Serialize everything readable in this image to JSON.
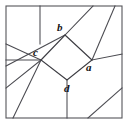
{
  "figure": {
    "canvas": {
      "width": 128,
      "height": 124
    },
    "background_color": "#ffffff",
    "line_color": "#4a4a50",
    "border_color": "#55555a",
    "label_color": "#111114",
    "border": {
      "x": 6,
      "y": 6,
      "width": 116,
      "height": 112
    },
    "labels": [
      {
        "id": "a",
        "text": "a",
        "x": 86,
        "y": 62,
        "vertex_x": 92,
        "vertex_y": 60
      },
      {
        "id": "b",
        "text": "b",
        "x": 57,
        "y": 22,
        "vertex_x": 65,
        "vertex_y": 35
      },
      {
        "id": "c",
        "text": "c",
        "x": 33,
        "y": 47,
        "vertex_x": 41,
        "vertex_y": 60
      },
      {
        "id": "d",
        "text": "d",
        "x": 64,
        "y": 83,
        "vertex_x": 67,
        "vertex_y": 80
      }
    ],
    "quadrilateral": {
      "name": "central-quadrilateral",
      "points": "65,35 92,60 67,80 41,60"
    },
    "segments": [
      {
        "name": "segment-b-to-top-edge",
        "x1": 65,
        "y1": 35,
        "x2": 93,
        "y2": 6
      },
      {
        "name": "segment-b-to-c-extended-left-edge",
        "x1": 65,
        "y1": 35,
        "x2": 6,
        "y2": 66
      },
      {
        "name": "segment-c-to-left-edge-horizontal",
        "x1": 41,
        "y1": 60,
        "x2": 6,
        "y2": 60
      },
      {
        "name": "segment-c-to-upper-left-edge",
        "x1": 41,
        "y1": 60,
        "x2": 6,
        "y2": 44
      },
      {
        "name": "segment-c-to-lower-left-edge",
        "x1": 41,
        "y1": 60,
        "x2": 6,
        "y2": 88
      },
      {
        "name": "segment-c-to-bottom-edge",
        "x1": 41,
        "y1": 60,
        "x2": 13,
        "y2": 118
      },
      {
        "name": "segment-a-to-top-right-edge",
        "x1": 92,
        "y1": 60,
        "x2": 115,
        "y2": 6
      },
      {
        "name": "segment-a-to-right-edge",
        "x1": 92,
        "y1": 60,
        "x2": 122,
        "y2": 54
      },
      {
        "name": "segment-d-to-bottom-edge",
        "x1": 67,
        "y1": 80,
        "x2": 67,
        "y2": 118
      },
      {
        "name": "segment-top-edge-divider-vertical",
        "x1": 40,
        "y1": 6,
        "x2": 40,
        "y2": 44
      },
      {
        "name": "segment-bottom-right-diagonal",
        "x1": 88,
        "y1": 118,
        "x2": 122,
        "y2": 88
      }
    ]
  }
}
